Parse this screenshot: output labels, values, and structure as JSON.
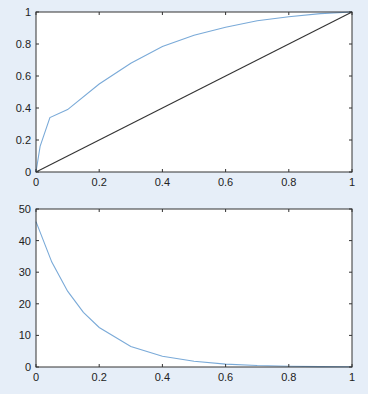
{
  "chart_data": [
    {
      "type": "line",
      "title": "",
      "xlabel": "",
      "ylabel": "",
      "xlim": [
        0,
        1
      ],
      "ylim": [
        0,
        1
      ],
      "grid": false,
      "xticks": [
        "0",
        "0.2",
        "0.4",
        "0.6",
        "0.8",
        "1"
      ],
      "yticks": [
        "0",
        "0.2",
        "0.4",
        "0.6",
        "0.8",
        "1"
      ],
      "series": [
        {
          "name": "curve",
          "color": "#7aaad8",
          "x": [
            0,
            0.013,
            0.044,
            0.1,
            0.2,
            0.3,
            0.4,
            0.5,
            0.6,
            0.7,
            0.8,
            0.9,
            1
          ],
          "y": [
            0,
            0.16,
            0.34,
            0.39,
            0.55,
            0.68,
            0.785,
            0.855,
            0.905,
            0.945,
            0.97,
            0.99,
            1
          ]
        },
        {
          "name": "diagonal",
          "color": "#333333",
          "x": [
            0,
            1
          ],
          "y": [
            0,
            1
          ]
        }
      ]
    },
    {
      "type": "line",
      "title": "",
      "xlabel": "",
      "ylabel": "",
      "xlim": [
        0,
        1
      ],
      "ylim": [
        0,
        50
      ],
      "grid": false,
      "xticks": [
        "0",
        "0.2",
        "0.4",
        "0.6",
        "0.8",
        "1"
      ],
      "yticks": [
        "0",
        "10",
        "20",
        "30",
        "40",
        "50"
      ],
      "series": [
        {
          "name": "decay",
          "color": "#7aaad8",
          "x": [
            0,
            0.05,
            0.1,
            0.15,
            0.2,
            0.3,
            0.4,
            0.5,
            0.6,
            0.7,
            0.8,
            0.9,
            1
          ],
          "y": [
            46,
            33.2,
            24,
            17.3,
            12.5,
            6.5,
            3.4,
            1.8,
            0.93,
            0.49,
            0.25,
            0.13,
            0.07
          ]
        }
      ]
    }
  ]
}
